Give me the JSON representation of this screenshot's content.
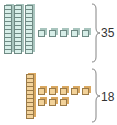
{
  "groups": [
    {
      "name": "top",
      "tens": 3,
      "ones": 5,
      "total_label": "35",
      "color": "#d7eee8"
    },
    {
      "name": "bottom",
      "tens": 1,
      "ones": 8,
      "total_label": "18",
      "color": "#f2d29a"
    }
  ]
}
